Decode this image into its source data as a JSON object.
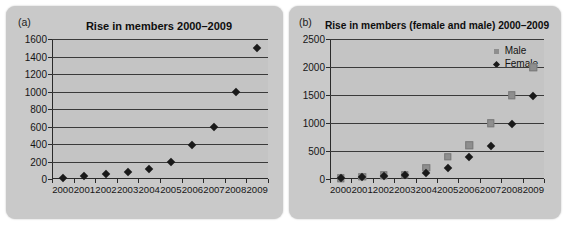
{
  "figure": {
    "background": "#ffffff",
    "panel_background": "#c9c9c9",
    "plot_background": "#c4c4c4"
  },
  "panel_a": {
    "label": "(a)",
    "title": "Rise in members 2000–2009"
  },
  "panel_b": {
    "label": "(b)",
    "title": "Rise in members (female and male) 2000–2009"
  },
  "chart_data": [
    {
      "id": "chart-a",
      "type": "scatter",
      "title": "Rise in members 2000–2009",
      "panel_label": "(a)",
      "xlabel": "",
      "ylabel": "",
      "categories": [
        "2000",
        "2001",
        "2002",
        "2003",
        "2004",
        "2005",
        "2006",
        "2007",
        "2008",
        "2009"
      ],
      "x": [
        2000,
        2001,
        2002,
        2003,
        2004,
        2005,
        2006,
        2007,
        2008,
        2009
      ],
      "values": [
        10,
        30,
        60,
        75,
        110,
        190,
        390,
        600,
        990,
        1500
      ],
      "ylim": [
        0,
        1600
      ],
      "yticks": [
        0,
        200,
        400,
        600,
        800,
        1000,
        1200,
        1400,
        1600
      ],
      "ytick_labels": [
        "0",
        "200",
        "400",
        "600",
        "800",
        "1000",
        "1200",
        "1400",
        "1600"
      ],
      "grid": true,
      "legend": false,
      "marker": "diamond",
      "marker_color": "#1a1a1a"
    },
    {
      "id": "chart-b",
      "type": "scatter",
      "title": "Rise in members (female and male) 2000–2009",
      "panel_label": "(b)",
      "xlabel": "",
      "ylabel": "",
      "categories": [
        "2000",
        "2001",
        "2002",
        "2003",
        "2004",
        "2005",
        "2006",
        "2007",
        "2008",
        "2009"
      ],
      "x": [
        2000,
        2001,
        2002,
        2003,
        2004,
        2005,
        2006,
        2007,
        2008,
        2009
      ],
      "series": [
        {
          "name": "Male",
          "marker": "square",
          "color": "#8e8e8e",
          "values": [
            15,
            40,
            65,
            80,
            200,
            400,
            600,
            1000,
            1500,
            2000
          ]
        },
        {
          "name": "Female",
          "marker": "diamond",
          "color": "#1a1a1a",
          "values": [
            10,
            30,
            55,
            70,
            110,
            190,
            390,
            590,
            990,
            1490
          ]
        }
      ],
      "ylim": [
        0,
        2500
      ],
      "yticks": [
        0,
        500,
        1000,
        1500,
        2000,
        2500
      ],
      "ytick_labels": [
        "0",
        "500",
        "1000",
        "1500",
        "2000",
        "2500"
      ],
      "grid": true,
      "legend": true,
      "legend_position": "top-right",
      "legend_entries": [
        "Male",
        "Female"
      ]
    }
  ]
}
